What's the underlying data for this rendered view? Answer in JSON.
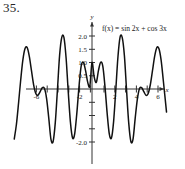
{
  "problem": {
    "number": "35."
  },
  "figure": {
    "function_label": "f(x) = sin 2x + cos 3x",
    "x_axis_name": "x",
    "y_axis_name": "y"
  },
  "chart_data": {
    "type": "line",
    "title": "",
    "subtitle": "",
    "annotations": [
      "f(x) = sin 2x + cos 3x"
    ],
    "xlabel": "x",
    "ylabel": "y",
    "xlim": [
      -7.2,
      6.9
    ],
    "ylim": [
      -2.35,
      2.35
    ],
    "grid": false,
    "legend": null,
    "x_ticks": [
      -6,
      -2,
      2,
      4,
      6
    ],
    "x_tick_labels": [
      "-6",
      "-2",
      "2",
      "4",
      "6"
    ],
    "y_ticks": [
      -2.0,
      -1.5,
      -1.0,
      -0.5,
      0.5,
      1.0,
      1.5,
      2.0
    ],
    "y_tick_labels": [
      "-2.0",
      "",
      "",
      "",
      "0.5",
      "1.0",
      "1.5",
      "2.0"
    ],
    "expression": "sin(2x) + cos(3x)",
    "series": [
      {
        "name": "f(x) = sin 2x + cos 3x",
        "color": "#111111",
        "x": [
          -7.2,
          -7.0,
          -6.8,
          -6.6,
          -6.4,
          -6.2,
          -6.0,
          -5.8,
          -5.6,
          -5.4,
          -5.2,
          -5.0,
          -4.8,
          -4.6,
          -4.4,
          -4.2,
          -4.0,
          -3.8,
          -3.6,
          -3.4,
          -3.2,
          -3.0,
          -2.8,
          -2.6,
          -2.4,
          -2.2,
          -2.0,
          -1.8,
          -1.6,
          -1.4,
          -1.2,
          -1.0,
          -0.8,
          -0.6,
          -0.4,
          -0.2,
          0.0,
          0.2,
          0.4,
          0.6,
          0.8,
          1.0,
          1.2,
          1.4,
          1.6,
          1.8,
          2.0,
          2.2,
          2.4,
          2.6,
          2.8,
          3.0,
          3.2,
          3.4,
          3.6,
          3.8,
          4.0,
          4.2,
          4.4,
          4.6,
          4.8,
          5.0,
          5.2,
          5.4,
          5.6,
          5.8,
          6.0,
          6.2,
          6.4,
          6.6,
          6.9
        ],
        "y": [
          -1.89,
          -1.34,
          -0.53,
          0.35,
          1.1,
          1.53,
          1.56,
          1.22,
          0.68,
          0.15,
          -0.17,
          -0.23,
          -0.1,
          0.05,
          0.02,
          -0.37,
          -1.11,
          -1.9,
          -1.98,
          -1.27,
          -0.03,
          1.27,
          1.95,
          1.95,
          1.18,
          -0.1,
          -1.24,
          -1.85,
          -1.68,
          -0.89,
          0.11,
          0.87,
          1.01,
          0.7,
          0.26,
          0.11,
          1.0,
          0.46,
          0.25,
          0.7,
          1.01,
          0.86,
          0.1,
          -0.9,
          -1.69,
          -1.85,
          -1.23,
          -0.05,
          1.2,
          1.96,
          1.94,
          1.26,
          -0.04,
          -1.28,
          -1.98,
          -1.89,
          -1.1,
          -0.38,
          0.02,
          0.05,
          -0.1,
          -0.24,
          -0.17,
          0.16,
          0.69,
          1.23,
          1.56,
          1.52,
          1.09,
          0.33,
          -0.87
        ]
      }
    ]
  }
}
